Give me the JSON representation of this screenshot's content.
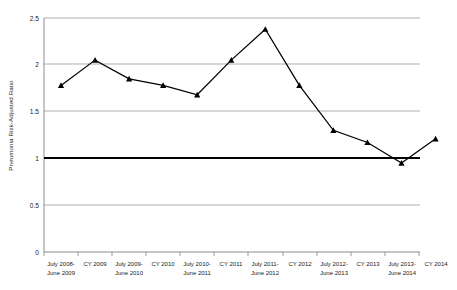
{
  "chart_data": {
    "type": "line",
    "title": "",
    "xlabel": "",
    "ylabel": "Pneumonia Risk-Adjusted Ratio",
    "ylim": [
      0,
      2.5
    ],
    "yticks": [
      0,
      0.5,
      1,
      1.5,
      2,
      2.5
    ],
    "ytick_labels": [
      "0",
      "0.5",
      "1",
      "1.5",
      "2",
      "2.5"
    ],
    "grid": true,
    "legend": "none",
    "categories": [
      "July 2008-\nJune 2009",
      "CY 2009",
      "July 2009-\nJune  2010",
      "CY 2010",
      "July 2010-\nJune 2011",
      "CY 2011",
      "July 2011-\nJune 2012",
      "CY 2012",
      "July 2012-\nJune 2013",
      "CY 2013",
      "July 2013-\nJune 2014",
      "CY 2014"
    ],
    "category_lines": [
      [
        "July 2008-",
        "June 2009"
      ],
      [
        "CY 2009",
        ""
      ],
      [
        "July 2009-",
        "June  2010"
      ],
      [
        "CY 2010",
        ""
      ],
      [
        "July 2010-",
        "June 2011"
      ],
      [
        "CY 2011",
        ""
      ],
      [
        "July 2011-",
        "June 2012"
      ],
      [
        "CY 2012",
        ""
      ],
      [
        "July 2012-",
        "June 2013"
      ],
      [
        "CY 2013",
        ""
      ],
      [
        "July 2013-",
        "June 2014"
      ],
      [
        "CY 2014",
        ""
      ]
    ],
    "values": [
      1.78,
      2.05,
      1.85,
      1.78,
      1.68,
      2.05,
      2.38,
      1.78,
      1.3,
      1.17,
      0.95,
      1.21
    ],
    "series": [
      {
        "name": "Pneumonia Risk-Adjusted Ratio",
        "values": [
          1.78,
          2.05,
          1.85,
          1.78,
          1.68,
          2.05,
          2.38,
          1.78,
          1.3,
          1.17,
          0.95,
          1.21
        ],
        "marker": "triangle",
        "color": "#000000"
      }
    ],
    "reference_line": {
      "name": "expected-ratio-reference",
      "value": 1.0,
      "color": "#000000"
    },
    "colors": {
      "series": "#000000",
      "grid": "#999999",
      "axis": "#808080",
      "reference": "#000000",
      "text": "#1a1a1a",
      "background": "#ffffff"
    }
  }
}
